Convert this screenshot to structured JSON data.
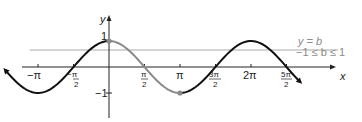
{
  "figure": {
    "axes": {
      "x_label": "x",
      "y_label": "y"
    },
    "y_ticks": [
      {
        "label": "1"
      },
      {
        "label": "−1"
      }
    ],
    "x_ticks": [
      {
        "num": "−π",
        "den": ""
      },
      {
        "num": "−π",
        "den": "2",
        "display": "−π/2"
      },
      {
        "num": "π",
        "den": "2"
      },
      {
        "num": "π",
        "den": ""
      },
      {
        "num": "3π",
        "den": "2"
      },
      {
        "num": "2π",
        "den": ""
      },
      {
        "num": "5π",
        "den": "2"
      }
    ],
    "annotation": {
      "line1": "y = b",
      "line2": "−1 ≤ b ≤ 1"
    },
    "curve": "y = cos x",
    "highlight_interval": "0 ≤ x ≤ π",
    "colors": {
      "curve": "#111111",
      "highlight": "#8a8a8a",
      "line": "#9a9a9a"
    }
  }
}
